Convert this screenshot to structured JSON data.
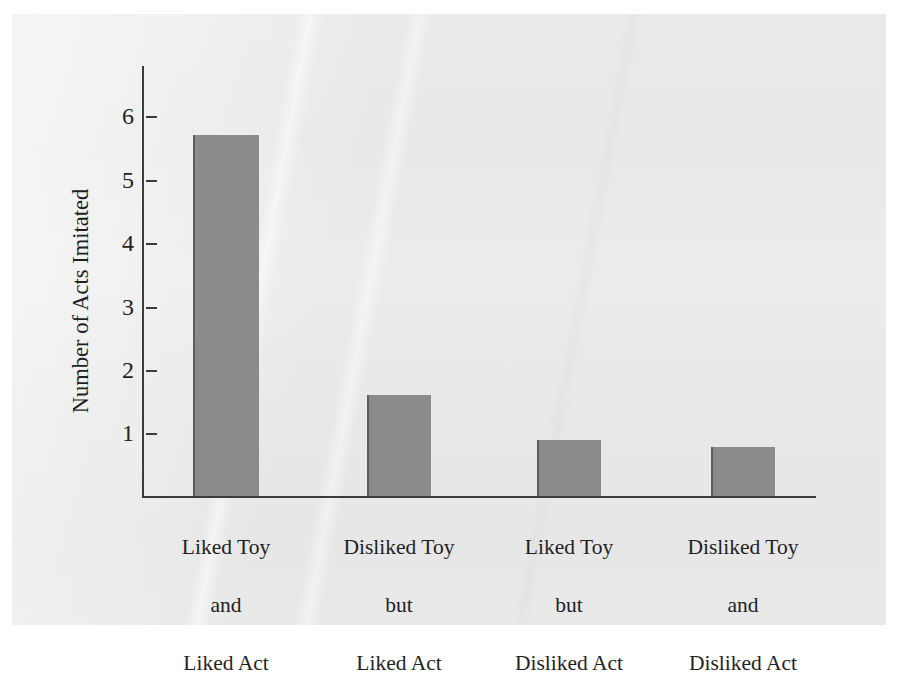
{
  "chart_data": {
    "type": "bar",
    "title": "",
    "xlabel": "",
    "ylabel": "Number of Acts Imitated",
    "ylim": [
      0,
      6.4
    ],
    "yticks": [
      1,
      2,
      3,
      4,
      5,
      6
    ],
    "ytick_labels": [
      "1",
      "2",
      "3",
      "4",
      "5",
      "6"
    ],
    "grid": false,
    "legend": "none",
    "categories": [
      "Liked Toy\nand\nLiked Act",
      "Disliked Toy\nbut\nLiked Act",
      "Liked Toy\nbut\nDisliked Act",
      "Disliked Toy\nand\nDisliked Act"
    ],
    "values": [
      5.7,
      1.6,
      0.89,
      0.78
    ],
    "bar_color": "#8b8b8b",
    "bar_edge_color": "#5d5d5d",
    "axis_color": "#3c3c3c",
    "background_color": "#e9e9e9"
  },
  "axis": {
    "y_title": "Number of Acts Imitated",
    "ticks": [
      {
        "label": "6",
        "value": 6
      },
      {
        "label": "5",
        "value": 5
      },
      {
        "label": "4",
        "value": 4
      },
      {
        "label": "3",
        "value": 3
      },
      {
        "label": "2",
        "value": 2
      },
      {
        "label": "1",
        "value": 1
      }
    ]
  },
  "bars": [
    {
      "value": 5.7,
      "line1": "Liked Toy",
      "line2": "and",
      "line3": "Liked Act"
    },
    {
      "value": 1.6,
      "line1": "Disliked Toy",
      "line2": "but",
      "line3": "Liked Act"
    },
    {
      "value": 0.89,
      "line1": "Liked Toy",
      "line2": "but",
      "line3": "Disliked Act"
    },
    {
      "value": 0.78,
      "line1": "Disliked Toy",
      "line2": "and",
      "line3": "Disliked Act"
    }
  ]
}
